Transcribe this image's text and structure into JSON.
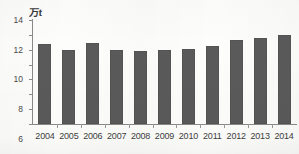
{
  "chart_data": {
    "type": "bar",
    "title": "",
    "subtitle": "",
    "xlabel": "",
    "ylabel": "万t",
    "unit_label": "万t",
    "categories": [
      "2004",
      "2005",
      "2006",
      "2007",
      "2008",
      "2009",
      "2010",
      "2011",
      "2012",
      "2013",
      "2014"
    ],
    "values": [
      10.8,
      10.0,
      10.9,
      9.9,
      9.8,
      9.9,
      10.1,
      10.5,
      11.3,
      11.6,
      12.0
    ],
    "series": [
      {
        "name": "",
        "values": [
          10.8,
          10.0,
          10.9,
          9.9,
          9.8,
          9.9,
          10.1,
          10.5,
          11.3,
          11.6,
          12.0
        ]
      }
    ],
    "ylim": [
      0,
      14
    ],
    "yticks": [
      0,
      2,
      4,
      6,
      8,
      10,
      12,
      14
    ],
    "ytick_labels": [
      "0",
      "2",
      "4",
      "6",
      "8",
      "10",
      "12",
      "14"
    ],
    "grid": false,
    "legend": false,
    "legend_position": "none",
    "bar_color": "#5a5a5a",
    "axis_color": "#8a8a8a",
    "text_color": "#3d3d3d",
    "background_color": "#fdfdfc"
  }
}
